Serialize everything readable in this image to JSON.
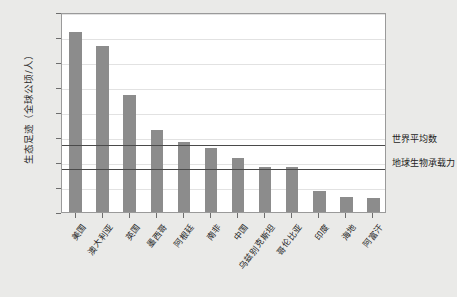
{
  "chart_data": {
    "type": "bar",
    "title": "",
    "xlabel": "",
    "ylabel": "生态足迹（全球公顷/人）",
    "ylim": [
      0,
      8
    ],
    "yticks": [
      0,
      1,
      2,
      3,
      4,
      5,
      6,
      7,
      8
    ],
    "ytick_labels": [
      "0",
      "1",
      "2",
      "3",
      "4",
      "5",
      "6",
      "7",
      "8"
    ],
    "grid": true,
    "legend": "none",
    "bar_color": "#8c8c8c",
    "categories": [
      "美国",
      "澳大利亚",
      "英国",
      "墨西哥",
      "阿根廷",
      "南非",
      "中国",
      "乌兹别克斯坦",
      "哥伦比亚",
      "印度",
      "海地",
      "阿富汗"
    ],
    "values": [
      7.2,
      6.65,
      4.7,
      3.3,
      2.8,
      2.55,
      2.15,
      1.8,
      1.8,
      0.85,
      0.6,
      0.55
    ],
    "reference_lines": [
      {
        "label": "世界平均数",
        "value": 2.75
      },
      {
        "label": "地球生物承载力",
        "value": 1.8
      }
    ]
  },
  "annotations": {
    "world_average": "世界平均数",
    "biocapacity": "地球生物承载力"
  }
}
